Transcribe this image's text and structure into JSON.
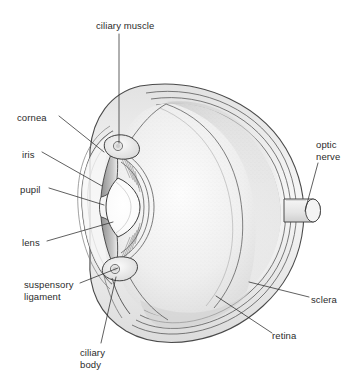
{
  "figure": {
    "style": "pencil line drawing",
    "background_color": "#ffffff",
    "ink_color": "#2b2b2b"
  },
  "labels": [
    {
      "id": "ciliary-muscle",
      "text": "ciliary muscle",
      "x": 96,
      "y": 20,
      "lines": [
        "ciliary muscle"
      ]
    },
    {
      "id": "cornea",
      "text": "cornea",
      "x": 17,
      "y": 112,
      "lines": [
        "cornea"
      ]
    },
    {
      "id": "iris",
      "text": "iris",
      "x": 22,
      "y": 149,
      "lines": [
        "iris"
      ]
    },
    {
      "id": "pupil",
      "text": "pupil",
      "x": 20,
      "y": 184,
      "lines": [
        "pupil"
      ]
    },
    {
      "id": "lens",
      "text": "lens",
      "x": 22,
      "y": 237,
      "lines": [
        "lens"
      ]
    },
    {
      "id": "suspensory-ligament",
      "text": "suspensory ligament",
      "x": 24,
      "y": 279,
      "lines": [
        "suspensory",
        "ligament"
      ]
    },
    {
      "id": "ciliary-body",
      "text": "ciliary body",
      "x": 80,
      "y": 347,
      "lines": [
        "ciliary",
        "body"
      ]
    },
    {
      "id": "optic-nerve",
      "text": "optic nerve",
      "x": 316,
      "y": 139,
      "lines": [
        "optic",
        "nerve"
      ]
    },
    {
      "id": "sclera",
      "text": "sclera",
      "x": 311,
      "y": 294,
      "lines": [
        "sclera"
      ]
    },
    {
      "id": "retina",
      "text": "retina",
      "x": 272,
      "y": 330,
      "lines": [
        "retina"
      ]
    }
  ],
  "leaders": [
    {
      "id": "leader-ciliary-muscle",
      "from": [
        119,
        34
      ],
      "to": [
        119,
        143
      ]
    },
    {
      "id": "leader-cornea",
      "from": [
        59,
        116
      ],
      "to": [
        104,
        152
      ]
    },
    {
      "id": "leader-iris",
      "from": [
        42,
        152
      ],
      "to": [
        102,
        186
      ]
    },
    {
      "id": "leader-pupil",
      "from": [
        49,
        188
      ],
      "to": [
        104,
        205
      ]
    },
    {
      "id": "leader-lens",
      "from": [
        47,
        241
      ],
      "to": [
        113,
        222
      ]
    },
    {
      "id": "leader-suspensory-ligament",
      "from": [
        80,
        283
      ],
      "to": [
        118,
        268
      ]
    },
    {
      "id": "leader-ciliary-body",
      "from": [
        101,
        343
      ],
      "to": [
        116,
        277
      ]
    },
    {
      "id": "leader-optic-nerve",
      "from": [
        318,
        163
      ],
      "to": [
        305,
        211
      ]
    },
    {
      "id": "leader-sclera",
      "from": [
        309,
        297
      ],
      "to": [
        249,
        282
      ]
    },
    {
      "id": "leader-retina",
      "from": [
        272,
        333
      ],
      "to": [
        216,
        296
      ]
    }
  ],
  "structures": [
    {
      "id": "sclera-outer-globe",
      "name": "sclera"
    },
    {
      "id": "choroid-layer",
      "name": "choroid"
    },
    {
      "id": "retina-layer",
      "name": "retina"
    },
    {
      "id": "vitreous-chamber",
      "name": "vitreous humour"
    },
    {
      "id": "cornea-dome",
      "name": "cornea"
    },
    {
      "id": "iris-upper-leaf",
      "name": "iris"
    },
    {
      "id": "iris-lower-leaf",
      "name": "iris"
    },
    {
      "id": "pupil-aperture",
      "name": "pupil"
    },
    {
      "id": "lens-body",
      "name": "lens"
    },
    {
      "id": "ciliary-muscle-upper",
      "name": "ciliary muscle"
    },
    {
      "id": "ciliary-body-lower",
      "name": "ciliary body"
    },
    {
      "id": "suspensory-fibres",
      "name": "suspensory ligament"
    },
    {
      "id": "optic-nerve-stub",
      "name": "optic nerve"
    }
  ]
}
